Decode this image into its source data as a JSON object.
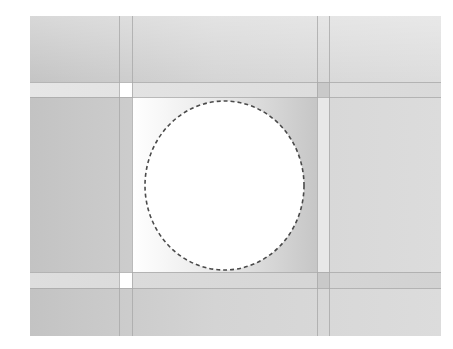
{
  "canvas": {
    "x": 30,
    "y": 16,
    "width": 411,
    "height": 320,
    "background_left": "#c3c3c3",
    "background_mid": "#d4d4d4",
    "background_right": "#dcdcdc"
  },
  "guides": {
    "color": "#a9a9a9",
    "vertical": [
      119,
      132,
      317,
      329
    ],
    "horizontal": [
      82,
      97,
      272,
      288
    ]
  },
  "bands": {
    "top_band": {
      "y": 82,
      "height": 15,
      "color_left": "#e6e6e6",
      "color_right": "#d9d9d9"
    },
    "bottom_band": {
      "y": 272,
      "height": 16,
      "color_left": "#dedede",
      "color_right": "#d2d2d2"
    }
  },
  "inner_square": {
    "x": 132,
    "y": 97,
    "width": 185,
    "height": 175,
    "gradient_start": "#ffffff",
    "gradient_end": "#c6c6c6"
  },
  "side_strip": {
    "x": 317,
    "y": 97,
    "width": 12,
    "height": 175,
    "color": "#e8e8e8"
  },
  "corner_cells": [
    {
      "x": 119,
      "y": 82,
      "width": 13,
      "height": 15,
      "color": "#ffffff"
    },
    {
      "x": 119,
      "y": 272,
      "width": 13,
      "height": 16,
      "color": "#ffffff"
    },
    {
      "x": 317,
      "y": 82,
      "width": 12,
      "height": 15,
      "color": "#c9c9c9"
    },
    {
      "x": 317,
      "y": 272,
      "width": 12,
      "height": 16,
      "color": "#c9c9c9"
    }
  ],
  "selection": {
    "shape": "ellipse",
    "cx": 224.5,
    "cy": 185.5,
    "rx": 79.5,
    "ry": 84.5,
    "fill": "#ffffff",
    "stroke": "#4a4a4a",
    "dash": "4 3",
    "stroke_width": 1.6
  }
}
